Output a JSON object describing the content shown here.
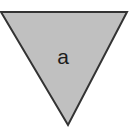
{
  "figure": {
    "type": "geometric-shape-figure",
    "background_color": "#ffffff",
    "width": 129,
    "height": 138,
    "shape": {
      "name": "triangle",
      "orientation": "pointing-down",
      "label": "a",
      "fill_color": "#c0c0c0",
      "stroke_color": "#333333",
      "stroke_width": 2,
      "vertices": [
        {
          "x": 1,
          "y": 12
        },
        {
          "x": 127,
          "y": 12
        },
        {
          "x": 68,
          "y": 125
        }
      ],
      "label_position": {
        "x": 63,
        "y": 56
      }
    }
  }
}
